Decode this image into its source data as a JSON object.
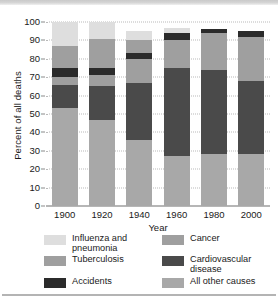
{
  "chart": {
    "type": "bar",
    "title": "",
    "xlabel": "Year",
    "ylabel": "Percent of all deaths"
  },
  "axis": {
    "y_ticks": [
      "100",
      "90",
      "80",
      "70",
      "60",
      "50",
      "40",
      "30",
      "20",
      "10",
      "0"
    ],
    "x_ticks": [
      "1900",
      "1920",
      "1940",
      "1960",
      "1980",
      "2000"
    ]
  },
  "legend": {
    "left": [
      {
        "label": "Influenza and\npneumonia",
        "color": "#dedede",
        "key": "influenza-and-pneumonia"
      },
      {
        "label": "Tuberculosis",
        "color": "#9f9f9f",
        "key": "tuberculosis"
      },
      {
        "label": "Accidents",
        "color": "#2b2b2b",
        "key": "accidents"
      }
    ],
    "right": [
      {
        "label": "Cancer",
        "color": "#9f9f9f",
        "key": "cancer"
      },
      {
        "label": "Cardiovascular\ndisease",
        "color": "#4a4a4a",
        "key": "cardiovascular-disease"
      },
      {
        "label": "All other causes",
        "color": "#a8a8a8",
        "key": "all-other-causes"
      }
    ]
  },
  "colors": {
    "influenza": "#dedede",
    "tuberculosis": "#9f9f9f",
    "accidents": "#2b2b2b",
    "cancer": "#9f9f9f",
    "cardiovascular": "#4a4a4a",
    "other": "#a8a8a8",
    "gridline": "#b9b9b9",
    "axis": "#6e6e6e",
    "text": "#1a1a1a"
  },
  "chart_data": {
    "type": "bar",
    "subtype": "stacked",
    "title": "",
    "xlabel": "Year",
    "ylabel": "Percent of all deaths",
    "ylim": [
      0,
      100
    ],
    "yticks": [
      0,
      10,
      20,
      30,
      40,
      50,
      60,
      70,
      80,
      90,
      100
    ],
    "grid": true,
    "legend_position": "below",
    "categories": [
      "1900",
      "1920",
      "1940",
      "1960",
      "1980",
      "2000"
    ],
    "series": [
      {
        "name": "All other causes",
        "color": "#a8a8a8",
        "values": [
          53,
          47,
          36,
          27,
          28,
          28
        ]
      },
      {
        "name": "Cardiovascular disease",
        "color": "#4a4a4a",
        "values": [
          12,
          13,
          31,
          48,
          46,
          40
        ]
      },
      {
        "name": "Cancer",
        "color": "#9f9f9f",
        "values": [
          4,
          4,
          0,
          0,
          0,
          0
        ]
      },
      {
        "name": "Accidents",
        "color": "#2b2b2b",
        "values": [
          4,
          4,
          3,
          0,
          0,
          0
        ]
      },
      {
        "name": "Tuberculosis",
        "color": "#9f9f9f",
        "values": [
          13,
          17,
          21,
          18,
          19,
          27
        ]
      },
      {
        "name": "Influenza and pneumonia",
        "color": "#dedede",
        "values": [
          13,
          9,
          5,
          4,
          2,
          0
        ]
      }
    ],
    "stacks": [
      {
        "year": "1900",
        "segments": [
          {
            "name": "All other causes",
            "start": 0,
            "end": 53,
            "color": "#a8a8a8"
          },
          {
            "name": "Cardiovascular disease",
            "start": 53,
            "end": 66,
            "color": "#4a4a4a"
          },
          {
            "name": "Cancer",
            "start": 66,
            "end": 70,
            "color": "#9f9f9f"
          },
          {
            "name": "Accidents",
            "start": 70,
            "end": 75,
            "color": "#2b2b2b"
          },
          {
            "name": "Tuberculosis",
            "start": 75,
            "end": 87,
            "color": "#9f9f9f"
          },
          {
            "name": "Influenza and pneumonia",
            "start": 87,
            "end": 100,
            "color": "#dedede"
          }
        ]
      },
      {
        "year": "1920",
        "segments": [
          {
            "name": "All other causes",
            "start": 0,
            "end": 47,
            "color": "#a8a8a8"
          },
          {
            "name": "Cardiovascular disease",
            "start": 47,
            "end": 65,
            "color": "#4a4a4a"
          },
          {
            "name": "Cancer",
            "start": 65,
            "end": 71,
            "color": "#9f9f9f"
          },
          {
            "name": "Accidents",
            "start": 71,
            "end": 75,
            "color": "#2b2b2b"
          },
          {
            "name": "Tuberculosis",
            "start": 75,
            "end": 91,
            "color": "#9f9f9f"
          },
          {
            "name": "Influenza and pneumonia",
            "start": 91,
            "end": 100,
            "color": "#dedede"
          }
        ]
      },
      {
        "year": "1940",
        "segments": [
          {
            "name": "All other causes",
            "start": 0,
            "end": 36,
            "color": "#a8a8a8"
          },
          {
            "name": "Cardiovascular disease",
            "start": 36,
            "end": 67,
            "color": "#4a4a4a"
          },
          {
            "name": "Cancer",
            "start": 67,
            "end": 80,
            "color": "#9f9f9f"
          },
          {
            "name": "Accidents",
            "start": 80,
            "end": 83,
            "color": "#2b2b2b"
          },
          {
            "name": "Tuberculosis",
            "start": 83,
            "end": 90,
            "color": "#9f9f9f"
          },
          {
            "name": "Influenza and pneumonia",
            "start": 90,
            "end": 95,
            "color": "#dedede"
          }
        ]
      },
      {
        "year": "1960",
        "segments": [
          {
            "name": "All other causes",
            "start": 0,
            "end": 27,
            "color": "#a8a8a8"
          },
          {
            "name": "Cardiovascular disease",
            "start": 27,
            "end": 75,
            "color": "#4a4a4a"
          },
          {
            "name": "Cancer",
            "start": 75,
            "end": 90,
            "color": "#9f9f9f"
          },
          {
            "name": "Accidents",
            "start": 90,
            "end": 94,
            "color": "#2b2b2b"
          },
          {
            "name": "Influenza and pneumonia",
            "start": 94,
            "end": 97,
            "color": "#dedede"
          }
        ]
      },
      {
        "year": "1980",
        "segments": [
          {
            "name": "All other causes",
            "start": 0,
            "end": 28,
            "color": "#a8a8a8"
          },
          {
            "name": "Cardiovascular disease",
            "start": 28,
            "end": 74,
            "color": "#4a4a4a"
          },
          {
            "name": "Cancer",
            "start": 74,
            "end": 94,
            "color": "#9f9f9f"
          },
          {
            "name": "Accidents",
            "start": 94,
            "end": 96,
            "color": "#2b2b2b"
          }
        ]
      },
      {
        "year": "2000",
        "segments": [
          {
            "name": "All other causes",
            "start": 0,
            "end": 28,
            "color": "#a8a8a8"
          },
          {
            "name": "Cardiovascular disease",
            "start": 28,
            "end": 68,
            "color": "#4a4a4a"
          },
          {
            "name": "Cancer",
            "start": 68,
            "end": 92,
            "color": "#9f9f9f"
          },
          {
            "name": "Accidents",
            "start": 92,
            "end": 95,
            "color": "#2b2b2b"
          }
        ]
      }
    ]
  }
}
